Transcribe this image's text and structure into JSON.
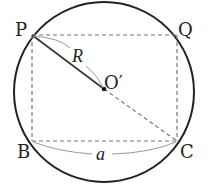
{
  "diagram": {
    "type": "geometry",
    "colors": {
      "circle": "#222222",
      "dashed": "#777777",
      "radius": "#333333",
      "arc_label_line": "#999999",
      "text": "#222222"
    },
    "circle": {
      "cx": 104,
      "cy": 92,
      "r": 90
    },
    "points": {
      "P": {
        "label": "P",
        "x": 32,
        "y": 35
      },
      "Q": {
        "label": "Q",
        "x": 177,
        "y": 35
      },
      "B": {
        "label": "B",
        "x": 32,
        "y": 141
      },
      "C": {
        "label": "C",
        "x": 177,
        "y": 141
      },
      "O": {
        "label": "O′",
        "x": 104,
        "y": 89
      }
    },
    "labels": {
      "P": "P",
      "Q": "Q",
      "B": "B",
      "C": "C",
      "O": "O′",
      "R": "R",
      "a": "a"
    }
  }
}
